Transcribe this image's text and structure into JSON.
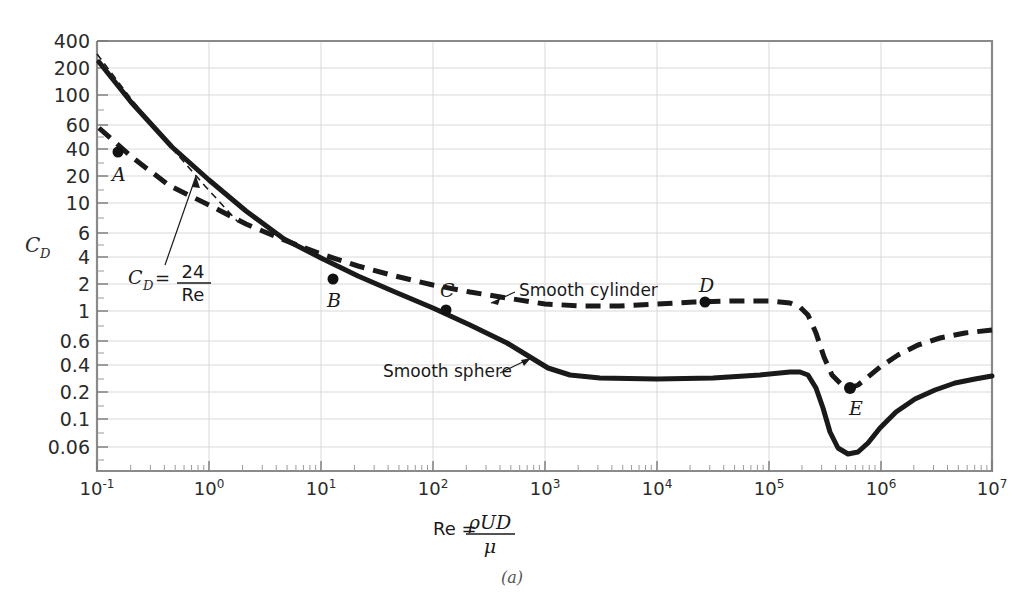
{
  "figure": {
    "caption": "(a)",
    "y_axis_label_main": "C",
    "y_axis_label_sub": "D",
    "x_axis_label_prefix": "Re =",
    "x_axis_numerator": "ρUD",
    "x_axis_denominator": "μ"
  },
  "axes": {
    "y_ticks": [
      {
        "label": "400",
        "value": 400
      },
      {
        "label": "200",
        "value": 200
      },
      {
        "label": "100",
        "value": 100
      },
      {
        "label": "60",
        "value": 60
      },
      {
        "label": "40",
        "value": 40
      },
      {
        "label": "20",
        "value": 20
      },
      {
        "label": "10",
        "value": 10
      },
      {
        "label": "6",
        "value": 6
      },
      {
        "label": "4",
        "value": 4
      },
      {
        "label": "2",
        "value": 2
      },
      {
        "label": "1",
        "value": 1
      },
      {
        "label": "0.6",
        "value": 0.6
      },
      {
        "label": "0.4",
        "value": 0.4
      },
      {
        "label": "0.2",
        "value": 0.2
      },
      {
        "label": "0.1",
        "value": 0.1
      },
      {
        "label": "0.06",
        "value": 0.06
      }
    ],
    "x_ticks": [
      {
        "base": "10",
        "exp": "-1",
        "value": -1
      },
      {
        "base": "10",
        "exp": "0",
        "value": 0
      },
      {
        "base": "10",
        "exp": "1",
        "value": 1
      },
      {
        "base": "10",
        "exp": "2",
        "value": 2
      },
      {
        "base": "10",
        "exp": "3",
        "value": 3
      },
      {
        "base": "10",
        "exp": "4",
        "value": 4
      },
      {
        "base": "10",
        "exp": "5",
        "value": 5
      },
      {
        "base": "10",
        "exp": "6",
        "value": 6
      },
      {
        "base": "10",
        "exp": "7",
        "value": 7
      }
    ],
    "xlim": [
      -1,
      7
    ],
    "ylim": [
      0.06,
      400
    ],
    "grid": true
  },
  "annotations": {
    "smooth_cylinder_label": "Smooth cylinder",
    "smooth_sphere_label": "Smooth sphere",
    "stokes_lhs": "C",
    "stokes_lhs_sub": "D",
    "stokes_eq": "=",
    "stokes_numerator": "24",
    "stokes_denominator": "Re"
  },
  "colors": {
    "curve": "#1a1a1a",
    "grid": "#d9d9d9",
    "frame": "#8a8a8a",
    "text": "#2b2b2b"
  },
  "chart_data": {
    "type": "line",
    "title": "",
    "xlabel": "Re = ρUD/μ",
    "ylabel": "C_D",
    "xscale": "log",
    "yscale": "log",
    "xlim": [
      0.1,
      10000000
    ],
    "ylim": [
      0.06,
      400
    ],
    "grid": true,
    "legend_position": "inline-annotations",
    "series": [
      {
        "name": "Smooth sphere",
        "style": "solid",
        "points": [
          [
            0.1,
            270
          ],
          [
            0.2,
            140
          ],
          [
            0.5,
            58
          ],
          [
            1.0,
            27
          ],
          [
            2.0,
            14.5
          ],
          [
            5.0,
            7.0
          ],
          [
            10,
            4.2
          ],
          [
            20,
            2.8
          ],
          [
            50,
            1.6
          ],
          [
            100,
            1.1
          ],
          [
            200,
            0.82
          ],
          [
            500,
            0.55
          ],
          [
            1000,
            0.45
          ],
          [
            2000,
            0.41
          ],
          [
            5000,
            0.4
          ],
          [
            10000,
            0.4
          ],
          [
            50000,
            0.42
          ],
          [
            100000,
            0.44
          ],
          [
            200000,
            0.44
          ],
          [
            300000,
            0.35
          ],
          [
            400000,
            0.12
          ],
          [
            500000,
            0.075
          ],
          [
            700000,
            0.085
          ],
          [
            1000000,
            0.13
          ],
          [
            2000000,
            0.22
          ],
          [
            5000000,
            0.33
          ],
          [
            10000000,
            0.38
          ]
        ]
      },
      {
        "name": "Smooth cylinder",
        "style": "dashed",
        "points": [
          [
            0.1,
            70
          ],
          [
            0.2,
            42
          ],
          [
            0.5,
            22
          ],
          [
            1.0,
            13.5
          ],
          [
            2.0,
            8.5
          ],
          [
            5.0,
            5.0
          ],
          [
            10,
            3.6
          ],
          [
            20,
            2.7
          ],
          [
            50,
            2.0
          ],
          [
            100,
            1.6
          ],
          [
            200,
            1.35
          ],
          [
            500,
            1.18
          ],
          [
            1000,
            1.1
          ],
          [
            2000,
            1.08
          ],
          [
            5000,
            1.1
          ],
          [
            10000,
            1.15
          ],
          [
            30000,
            1.2
          ],
          [
            100000,
            1.2
          ],
          [
            200000,
            1.1
          ],
          [
            300000,
            0.7
          ],
          [
            400000,
            0.36
          ],
          [
            500000,
            0.3
          ],
          [
            700000,
            0.36
          ],
          [
            1000000,
            0.45
          ],
          [
            2000000,
            0.58
          ],
          [
            5000000,
            0.7
          ],
          [
            10000000,
            0.76
          ]
        ]
      },
      {
        "name": "C_D = 24/Re (Stokes law)",
        "style": "thin-dashed",
        "points": [
          [
            0.1,
            240
          ],
          [
            0.3,
            80
          ],
          [
            0.7,
            34
          ],
          [
            1.3,
            18.5
          ]
        ]
      }
    ],
    "annotated_points": [
      {
        "label": "A",
        "series": "Smooth cylinder",
        "x": 0.15,
        "y": 40
      },
      {
        "label": "B",
        "series": "Smooth cylinder",
        "x": 12,
        "y": 3.4
      },
      {
        "label": "C",
        "series": "Smooth cylinder",
        "x": 120,
        "y": 1.55
      },
      {
        "label": "D",
        "series": "Smooth cylinder",
        "x": 25000,
        "y": 1.2
      },
      {
        "label": "E",
        "series": "Smooth cylinder",
        "x": 500000,
        "y": 0.3
      }
    ]
  }
}
